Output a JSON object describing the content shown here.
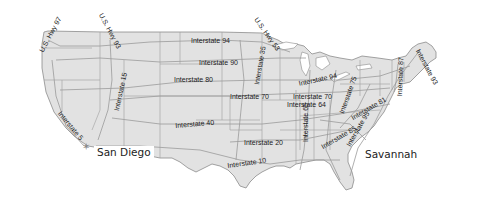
{
  "map": {
    "title": "United States Highway Map",
    "colors": {
      "land": "#e2e2e2",
      "border": "#8c8c8c",
      "roads": "#9a9a9a",
      "water": "#ffffff",
      "label": "#1a1a1a"
    },
    "cities": [
      {
        "name": "San Diego",
        "x": 94,
        "y": 147
      },
      {
        "name": "Savannah",
        "x": 362,
        "y": 149
      }
    ],
    "route_labels": [
      {
        "id": "us-hwy-97",
        "text": "U.S. Hwy 97",
        "x": 44,
        "y": 52,
        "rotate": -62
      },
      {
        "id": "us-hwy-93",
        "text": "U.S. Hwy 93",
        "x": 104,
        "y": 12,
        "rotate": 62
      },
      {
        "id": "us-hwy-53",
        "text": "U.S. Hwy 53",
        "x": 259,
        "y": 16,
        "rotate": 55
      },
      {
        "id": "interstate-94-west",
        "text": "Interstate 94",
        "x": 191,
        "y": 37,
        "rotate": 0
      },
      {
        "id": "interstate-90",
        "text": "Interstate 90",
        "x": 199,
        "y": 59,
        "rotate": 0
      },
      {
        "id": "interstate-80",
        "text": "Interstate 80",
        "x": 174,
        "y": 76,
        "rotate": 0
      },
      {
        "id": "interstate-35",
        "text": "Interstate 35",
        "x": 254,
        "y": 82,
        "rotate": -80
      },
      {
        "id": "interstate-70-west",
        "text": "Interstate 70",
        "x": 230,
        "y": 93,
        "rotate": 0
      },
      {
        "id": "interstate-15",
        "text": "Interstate 15",
        "x": 114,
        "y": 107,
        "rotate": -78
      },
      {
        "id": "interstate-5",
        "text": "Interstate 5",
        "x": 62,
        "y": 124,
        "rotate": 50
      },
      {
        "id": "interstate-40",
        "text": "Interstate 40",
        "x": 175,
        "y": 123,
        "rotate": -5
      },
      {
        "id": "interstate-20",
        "text": "Interstate 20",
        "x": 244,
        "y": 139,
        "rotate": 0
      },
      {
        "id": "interstate-10",
        "text": "Interstate 10",
        "x": 228,
        "y": 163,
        "rotate": -8
      },
      {
        "id": "interstate-94-east",
        "text": "Interstate 94",
        "x": 299,
        "y": 76,
        "rotate": -12
      },
      {
        "id": "interstate-75",
        "text": "Interstate 75",
        "x": 344,
        "y": 70,
        "rotate": -70
      },
      {
        "id": "interstate-70-east",
        "text": "Interstate 70",
        "x": 293,
        "y": 93,
        "rotate": 0
      },
      {
        "id": "interstate-64",
        "text": "Interstate 64",
        "x": 287,
        "y": 101,
        "rotate": 0
      },
      {
        "id": "interstate-81",
        "text": "Interstate 81",
        "x": 363,
        "y": 108,
        "rotate": -30
      },
      {
        "id": "interstate-65",
        "text": "Interstate 65",
        "x": 304,
        "y": 139,
        "rotate": -90
      },
      {
        "id": "interstate-85",
        "text": "Interstate 85",
        "x": 332,
        "y": 136,
        "rotate": -30
      },
      {
        "id": "interstate-95",
        "text": "Interstate 95",
        "x": 354,
        "y": 130,
        "rotate": -60
      },
      {
        "id": "interstate-87",
        "text": "Interstate 87",
        "x": 400,
        "y": 80,
        "rotate": -88
      },
      {
        "id": "interstate-93",
        "text": "Interstate 93",
        "x": 421,
        "y": 48,
        "rotate": 62
      }
    ]
  }
}
